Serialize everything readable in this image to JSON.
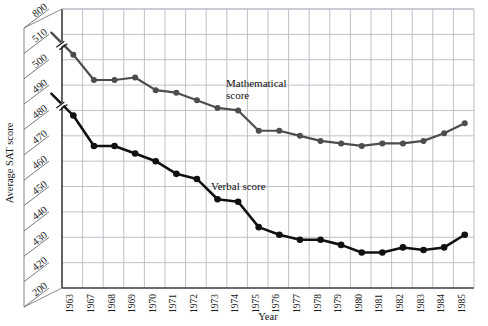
{
  "figure": {
    "partial_title": "",
    "y_axis_title": "Average SAT score",
    "x_axis_title": "Year",
    "series_label_math": "Mathematical\nscore",
    "series_label_math_line1": "Mathematical",
    "series_label_math_line2": "score",
    "series_label_verbal": "Verbal score",
    "colors": {
      "math_line": "#4d4d4d",
      "verbal_line": "#111111",
      "grid": "#b9b9c4",
      "frame": "#3a3a42",
      "text": "#1a1a1a"
    }
  },
  "chart_data": {
    "type": "line",
    "title": "",
    "xlabel": "Year",
    "ylabel": "Average SAT score",
    "grid": true,
    "legend": "inline-annotations",
    "axis_break": true,
    "axis_break_note": "y-axis broken between 200 and 420, and between 510 and 800",
    "categories": [
      "1963",
      "1967",
      "1968",
      "1969",
      "1970",
      "1971",
      "1972",
      "1973",
      "1974",
      "1975",
      "1976",
      "1977",
      "1978",
      "1979",
      "1980",
      "1981",
      "1982",
      "1983",
      "1984",
      "1985"
    ],
    "ytick_labels": [
      "200",
      "420",
      "430",
      "440",
      "450",
      "460",
      "470",
      "480",
      "490",
      "500",
      "510",
      "800"
    ],
    "ylim": [
      420,
      510
    ],
    "series": [
      {
        "name": "Mathematical score",
        "color": "#4d4d4d",
        "values": [
          502,
          492,
          492,
          493,
          488,
          487,
          484,
          481,
          480,
          472,
          472,
          470,
          468,
          467,
          466,
          467,
          467,
          468,
          471,
          475
        ]
      },
      {
        "name": "Verbal score",
        "color": "#111111",
        "values": [
          478,
          466,
          466,
          463,
          460,
          455,
          453,
          445,
          444,
          434,
          431,
          429,
          429,
          427,
          424,
          424,
          426,
          425,
          426,
          431
        ]
      }
    ]
  }
}
